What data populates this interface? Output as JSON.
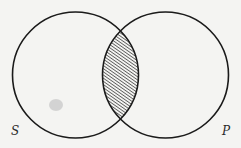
{
  "diagram": {
    "type": "venn",
    "sets": [
      {
        "id": "S",
        "label": "S",
        "cx": 75.5,
        "cy": 75,
        "r": 63
      },
      {
        "id": "P",
        "label": "P",
        "cx": 165.5,
        "cy": 75,
        "r": 63
      }
    ],
    "shaded_region": "S ∩ P",
    "shading": "hatched",
    "colors": {
      "background": "#f4f4f2",
      "stroke": "#1a1a1a",
      "hatch": "#2a2a2a",
      "smudge": "#c8c8c8"
    }
  }
}
